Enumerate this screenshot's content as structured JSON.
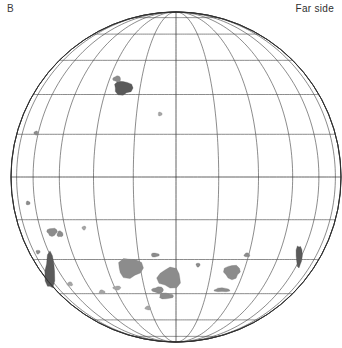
{
  "figure": {
    "panel_label": "B",
    "side_label": "Far side",
    "type": "orthographic-globe-map"
  },
  "globe": {
    "center_x": 176,
    "center_y": 177,
    "radius": 165,
    "projection": "orthographic",
    "graticule": {
      "meridian_step_deg": 15,
      "parallel_step_deg": 15,
      "meridian_count": 13,
      "parallel_count": 11,
      "equator_y": 177,
      "central_meridian_x": 176,
      "grid_on": true,
      "stroke_color": "#454545"
    },
    "limb": {
      "stroke_color": "#2a2a2a",
      "fill": "#ffffff"
    }
  },
  "features": {
    "fill_color": "#8c8c8c",
    "dark_fill_color": "#5a5a5a",
    "light_fill_color": "#a5a5a5",
    "patches": [
      {
        "name": "north-patch-small",
        "cx": 123,
        "cy": 88,
        "rx": 9,
        "ry": 7,
        "tone": "dark"
      },
      {
        "name": "north-patch-speck",
        "cx": 117,
        "cy": 79,
        "rx": 4,
        "ry": 3,
        "tone": "normal"
      },
      {
        "name": "mid-north-speck",
        "cx": 160,
        "cy": 114,
        "rx": 2,
        "ry": 2,
        "tone": "light"
      },
      {
        "name": "upper-left-limb-speck",
        "cx": 36,
        "cy": 133,
        "rx": 2,
        "ry": 2,
        "tone": "normal"
      },
      {
        "name": "left-limb-speck-a",
        "cx": 28,
        "cy": 203,
        "rx": 2,
        "ry": 2,
        "tone": "normal"
      },
      {
        "name": "left-mid-speck",
        "cx": 84,
        "cy": 228,
        "rx": 2,
        "ry": 2,
        "tone": "light"
      },
      {
        "name": "left-upper-patch",
        "cx": 60,
        "cy": 234,
        "rx": 3,
        "ry": 3,
        "tone": "normal"
      },
      {
        "name": "left-patch-b",
        "cx": 52,
        "cy": 232,
        "rx": 5,
        "ry": 4,
        "tone": "normal"
      },
      {
        "name": "left-limb-elongated",
        "cx": 50,
        "cy": 271,
        "rx": 5,
        "ry": 18,
        "tone": "dark"
      },
      {
        "name": "left-limb-speck-b",
        "cx": 38,
        "cy": 252,
        "rx": 2,
        "ry": 2,
        "tone": "normal"
      },
      {
        "name": "south-left-speck",
        "cx": 70,
        "cy": 284,
        "rx": 3,
        "ry": 2,
        "tone": "light"
      },
      {
        "name": "mare-moscoviense",
        "cx": 130,
        "cy": 268,
        "rx": 12,
        "ry": 10,
        "tone": "normal"
      },
      {
        "name": "center-basin-large",
        "cx": 170,
        "cy": 278,
        "rx": 12,
        "ry": 10,
        "tone": "normal"
      },
      {
        "name": "center-speck-upper",
        "cx": 155,
        "cy": 255,
        "rx": 4,
        "ry": 2,
        "tone": "normal"
      },
      {
        "name": "center-crescent-a",
        "cx": 158,
        "cy": 290,
        "rx": 6,
        "ry": 3,
        "tone": "normal"
      },
      {
        "name": "center-crescent-b",
        "cx": 166,
        "cy": 296,
        "rx": 7,
        "ry": 3,
        "tone": "normal"
      },
      {
        "name": "center-speck-left",
        "cx": 117,
        "cy": 288,
        "rx": 4,
        "ry": 2,
        "tone": "light"
      },
      {
        "name": "lower-left-speck",
        "cx": 102,
        "cy": 292,
        "rx": 3,
        "ry": 2,
        "tone": "light"
      },
      {
        "name": "right-basin",
        "cx": 232,
        "cy": 272,
        "rx": 8,
        "ry": 7,
        "tone": "normal"
      },
      {
        "name": "right-hook",
        "cx": 222,
        "cy": 290,
        "rx": 8,
        "ry": 2,
        "tone": "normal"
      },
      {
        "name": "right-speck-a",
        "cx": 198,
        "cy": 265,
        "rx": 2,
        "ry": 2,
        "tone": "normal"
      },
      {
        "name": "right-speck-b",
        "cx": 247,
        "cy": 255,
        "rx": 3,
        "ry": 2,
        "tone": "normal"
      },
      {
        "name": "right-limb-streak",
        "cx": 299,
        "cy": 256,
        "rx": 3,
        "ry": 11,
        "tone": "dark"
      },
      {
        "name": "south-center-speck",
        "cx": 148,
        "cy": 308,
        "rx": 3,
        "ry": 2,
        "tone": "light"
      }
    ]
  },
  "chart_data": {
    "type": "map",
    "title": "Far side",
    "panel": "B",
    "projection": "orthographic",
    "center_lon_deg": 180,
    "center_lat_deg": 0,
    "graticule_interval_deg": 15,
    "lon_range_deg": [
      90,
      270
    ],
    "lat_range_deg": [
      -90,
      90
    ],
    "legend": "none",
    "grid": true
  }
}
